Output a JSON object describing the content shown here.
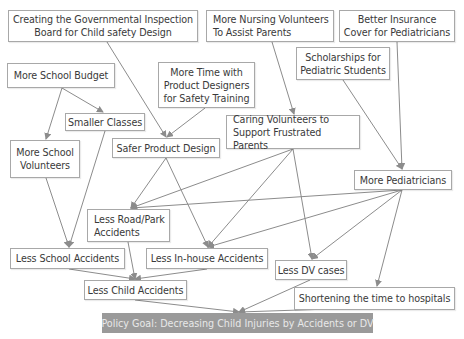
{
  "diagram": {
    "type": "policy logic model / causal flow diagram",
    "colors": {
      "box_border": "#a8a8a8",
      "text": "#3a3a3a",
      "arrow": "#8c8c8c",
      "goal_bg": "#9a9a9a",
      "goal_text": "#e8e8e8"
    },
    "nodes": [
      {
        "id": "gov_board",
        "label": "Creating the Governmental Inspection\nBoard for Child safety Design",
        "x": 8,
        "y": 10,
        "w": 190,
        "h": 32
      },
      {
        "id": "nursing_vol",
        "label": "More Nursing Volunteers\nTo Assist Parents",
        "x": 206,
        "y": 10,
        "w": 128,
        "h": 32,
        "align": "left"
      },
      {
        "id": "insurance",
        "label": "Better Insurance\nCover for Pediatricians",
        "x": 339,
        "y": 10,
        "w": 116,
        "h": 32
      },
      {
        "id": "school_budget",
        "label": "More School Budget",
        "x": 7,
        "y": 63,
        "w": 108,
        "h": 25
      },
      {
        "id": "product_designers",
        "label": "More Time with\nProduct Designers\nfor Safety Training",
        "x": 158,
        "y": 62,
        "w": 97,
        "h": 46
      },
      {
        "id": "scholarships",
        "label": "Scholarships for\nPediatric Students",
        "x": 296,
        "y": 47,
        "w": 94,
        "h": 33
      },
      {
        "id": "smaller_classes",
        "label": "Smaller Classes",
        "x": 65,
        "y": 113,
        "w": 80,
        "h": 18
      },
      {
        "id": "school_vol",
        "label": "More School\nVolunteers",
        "x": 10,
        "y": 140,
        "w": 70,
        "h": 38
      },
      {
        "id": "safer_design",
        "label": "Safer Product Design",
        "x": 112,
        "y": 138,
        "w": 108,
        "h": 20
      },
      {
        "id": "caring_vol",
        "label": "Caring Volunteers to\nSupport Frustrated Parents",
        "x": 226,
        "y": 115,
        "w": 134,
        "h": 34,
        "align": "left"
      },
      {
        "id": "pediatricians",
        "label": "More Pediatricians",
        "x": 354,
        "y": 170,
        "w": 98,
        "h": 20
      },
      {
        "id": "road_park",
        "label": "Less Road/Park\nAccidents",
        "x": 87,
        "y": 209,
        "w": 83,
        "h": 33,
        "align": "left"
      },
      {
        "id": "school_acc",
        "label": "Less School Accidents",
        "x": 10,
        "y": 248,
        "w": 115,
        "h": 21
      },
      {
        "id": "inhouse_acc",
        "label": "Less In-house Accidents",
        "x": 146,
        "y": 248,
        "w": 122,
        "h": 21
      },
      {
        "id": "dv_cases",
        "label": "Less DV cases",
        "x": 275,
        "y": 260,
        "w": 72,
        "h": 20
      },
      {
        "id": "child_acc",
        "label": "Less Child Accidents",
        "x": 84,
        "y": 280,
        "w": 103,
        "h": 20
      },
      {
        "id": "shorten_time",
        "label": "Shortening the time to hospitals",
        "x": 294,
        "y": 287,
        "w": 161,
        "h": 23
      }
    ],
    "goal": {
      "label": "Policy Goal: Decreasing Child Injuries by Accidents or DV",
      "x": 102,
      "y": 313,
      "w": 271,
      "h": 20
    },
    "edges": [
      {
        "from": "gov_board",
        "to": "safer_design",
        "x1": 107,
        "y1": 42,
        "x2": 166,
        "y2": 137
      },
      {
        "from": "school_budget",
        "to": "smaller_classes",
        "x1": 62,
        "y1": 88,
        "x2": 103,
        "y2": 112
      },
      {
        "from": "school_budget",
        "to": "school_vol",
        "x1": 62,
        "y1": 88,
        "x2": 46,
        "y2": 139
      },
      {
        "from": "product_designers",
        "to": "safer_design",
        "x1": 205,
        "y1": 108,
        "x2": 167,
        "y2": 137
      },
      {
        "from": "nursing_vol",
        "to": "caring_vol",
        "x1": 272,
        "y1": 42,
        "x2": 294,
        "y2": 114
      },
      {
        "from": "scholarships",
        "to": "pediatricians",
        "x1": 343,
        "y1": 80,
        "x2": 402,
        "y2": 169
      },
      {
        "from": "insurance",
        "to": "pediatricians",
        "x1": 397,
        "y1": 42,
        "x2": 402,
        "y2": 169
      },
      {
        "from": "smaller_classes",
        "to": "school_acc",
        "x1": 105,
        "y1": 131,
        "x2": 69,
        "y2": 247
      },
      {
        "from": "school_vol",
        "to": "school_acc",
        "x1": 46,
        "y1": 178,
        "x2": 69,
        "y2": 247
      },
      {
        "from": "safer_design",
        "to": "road_park",
        "x1": 166,
        "y1": 158,
        "x2": 131,
        "y2": 208
      },
      {
        "from": "safer_design",
        "to": "inhouse_acc",
        "x1": 166,
        "y1": 158,
        "x2": 208,
        "y2": 247
      },
      {
        "from": "caring_vol",
        "to": "road_park",
        "x1": 293,
        "y1": 149,
        "x2": 131,
        "y2": 208
      },
      {
        "from": "caring_vol",
        "to": "inhouse_acc",
        "x1": 293,
        "y1": 149,
        "x2": 208,
        "y2": 247
      },
      {
        "from": "caring_vol",
        "to": "dv_cases",
        "x1": 293,
        "y1": 149,
        "x2": 312,
        "y2": 259
      },
      {
        "from": "pediatricians",
        "to": "road_park",
        "x1": 402,
        "y1": 190,
        "x2": 131,
        "y2": 208
      },
      {
        "from": "pediatricians",
        "to": "inhouse_acc",
        "x1": 402,
        "y1": 190,
        "x2": 208,
        "y2": 247
      },
      {
        "from": "pediatricians",
        "to": "dv_cases",
        "x1": 402,
        "y1": 190,
        "x2": 312,
        "y2": 259
      },
      {
        "from": "pediatricians",
        "to": "shorten_time",
        "x1": 402,
        "y1": 190,
        "x2": 377,
        "y2": 286
      },
      {
        "from": "school_acc",
        "to": "child_acc",
        "x1": 69,
        "y1": 269,
        "x2": 135,
        "y2": 279
      },
      {
        "from": "road_park",
        "to": "child_acc",
        "x1": 128,
        "y1": 242,
        "x2": 135,
        "y2": 279
      },
      {
        "from": "inhouse_acc",
        "to": "child_acc",
        "x1": 207,
        "y1": 269,
        "x2": 135,
        "y2": 279
      },
      {
        "from": "child_acc",
        "to": "goal",
        "x1": 135,
        "y1": 300,
        "x2": 239,
        "y2": 312
      },
      {
        "from": "dv_cases",
        "to": "goal",
        "x1": 310,
        "y1": 280,
        "x2": 239,
        "y2": 312
      },
      {
        "from": "shorten_time",
        "to": "goal",
        "x1": 330,
        "y1": 309,
        "x2": 239,
        "y2": 312
      }
    ]
  }
}
